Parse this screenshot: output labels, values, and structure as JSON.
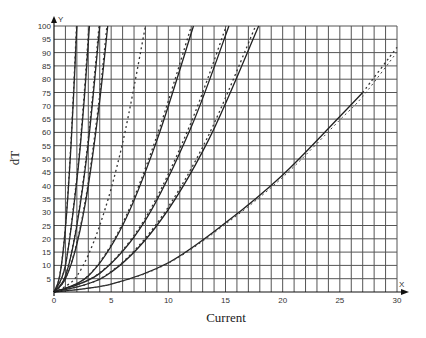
{
  "chart_data": {
    "type": "line",
    "title": "",
    "xlabel": "Current",
    "ylabel": "dT",
    "x_axis_marker": "X",
    "y_axis_marker": "Y",
    "xlim": [
      0,
      30
    ],
    "ylim": [
      0,
      100
    ],
    "x_ticks": [
      0,
      5,
      10,
      15,
      20,
      25,
      30
    ],
    "y_ticks": [
      5,
      10,
      15,
      20,
      25,
      30,
      35,
      40,
      45,
      50,
      55,
      60,
      65,
      70,
      75,
      80,
      85,
      90,
      95,
      100
    ],
    "grid": {
      "x_step": 1,
      "y_step": 5,
      "on": true
    },
    "legend": "none",
    "series": [
      {
        "name": "curve-1",
        "style": "solid+dashed",
        "x": [
          0,
          0.5,
          1.0,
          1.5,
          2.0
        ],
        "y": [
          0,
          6,
          24,
          56,
          100
        ]
      },
      {
        "name": "curve-2",
        "style": "solid+dashed",
        "x": [
          0,
          1.0,
          2.0,
          2.6,
          3.1
        ],
        "y": [
          0,
          10,
          42,
          70,
          100
        ]
      },
      {
        "name": "curve-3",
        "style": "solid+dashed",
        "x": [
          0,
          1.0,
          2.0,
          3.0,
          4.0
        ],
        "y": [
          0,
          6,
          25,
          56,
          100
        ]
      },
      {
        "name": "curve-4",
        "style": "solid+dashed",
        "x": [
          0,
          1.0,
          2.0,
          3.0,
          4.0,
          4.7
        ],
        "y": [
          0,
          5,
          18,
          40,
          72,
          100
        ]
      },
      {
        "name": "curve-5",
        "style": "dashed",
        "x": [
          0,
          2.0,
          4.0,
          6.0,
          8.0
        ],
        "y": [
          0,
          6,
          25,
          56,
          100
        ]
      },
      {
        "name": "curve-6",
        "style": "solid+dashed",
        "x": [
          0,
          3.0,
          6.0,
          9.0,
          12.2
        ],
        "y": [
          0,
          6,
          25,
          57,
          100
        ]
      },
      {
        "name": "curve-7",
        "style": "solid+dashed",
        "x": [
          0,
          4.0,
          8.0,
          12.0,
          15.3
        ],
        "y": [
          0,
          7,
          27,
          62,
          100
        ]
      },
      {
        "name": "curve-8",
        "style": "solid+dashed",
        "x": [
          0,
          4.5,
          9.0,
          13.5,
          17.9
        ],
        "y": [
          0,
          6,
          25,
          57,
          100
        ]
      },
      {
        "name": "curve-9",
        "style": "solid to 27, dashed to 30",
        "x": [
          0,
          5,
          10,
          15,
          20,
          25,
          27,
          30
        ],
        "y": [
          0,
          3,
          11,
          26,
          44,
          66,
          75,
          92
        ]
      }
    ]
  }
}
